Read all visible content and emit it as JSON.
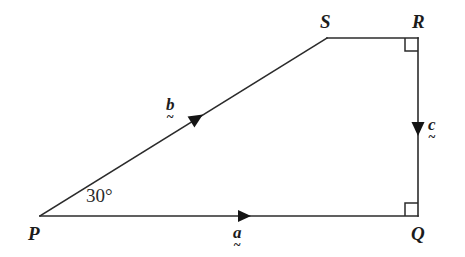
{
  "figure": {
    "kind": "vector-geometry-diagram",
    "width": 465,
    "height": 257,
    "background_color": "#ffffff",
    "stroke_color": "#2b2b2b",
    "stroke_width": 1.6,
    "vertices": [
      {
        "name": "P",
        "label": "P",
        "x": 40,
        "y": 216
      },
      {
        "name": "Q",
        "label": "Q",
        "x": 418,
        "y": 216
      },
      {
        "name": "R",
        "label": "R",
        "x": 418,
        "y": 38
      },
      {
        "name": "S",
        "label": "S",
        "x": 327,
        "y": 38
      }
    ],
    "edges": [
      {
        "name": "PQ",
        "from": "P",
        "to": "Q",
        "vector_label": "a"
      },
      {
        "name": "PS",
        "from": "P",
        "to": "S",
        "vector_label": "b"
      },
      {
        "name": "SR",
        "from": "S",
        "to": "R",
        "vector_label": ""
      },
      {
        "name": "RQ",
        "from": "R",
        "to": "Q",
        "vector_label": "c"
      }
    ],
    "arrow_markers": [
      {
        "name": "arrow-a",
        "x": 242,
        "y": 216,
        "angle_deg": 0,
        "edge": "PQ"
      },
      {
        "name": "arrow-b",
        "x": 198,
        "y": 117,
        "angle_deg": -26,
        "edge": "PS"
      },
      {
        "name": "arrow-c",
        "x": 418,
        "y": 128,
        "angle_deg": 90,
        "edge": "RQ"
      }
    ],
    "right_angle_marks": [
      {
        "name": "right-angle-R",
        "x": 418,
        "y": 38,
        "size": 13,
        "dx": -1,
        "dy": 1
      },
      {
        "name": "right-angle-Q",
        "x": 418,
        "y": 216,
        "size": 13,
        "dx": -1,
        "dy": -1
      }
    ]
  },
  "labels": {
    "vertex_P": "P",
    "vertex_Q": "Q",
    "vertex_R": "R",
    "vertex_S": "S",
    "angle_at_P": "30°",
    "vector_a": "a",
    "vector_b": "b",
    "vector_c": "c",
    "tilde": "~"
  }
}
